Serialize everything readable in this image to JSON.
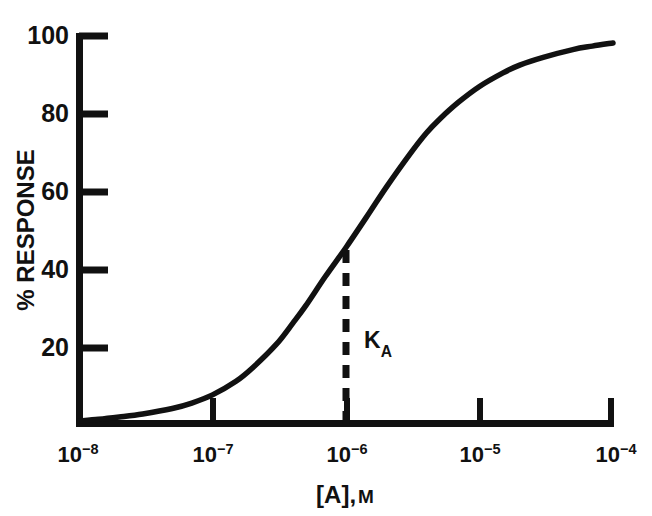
{
  "chart_data": {
    "type": "line",
    "title": "",
    "subtitle": "",
    "xlabel": "[A], M",
    "xlabel_parts": {
      "bracket_open": "[",
      "species": "A",
      "bracket_close": "]",
      "comma": ",",
      "unit": "M"
    },
    "ylabel": "% RESPONSE",
    "x_scale": "log",
    "y_scale": "linear",
    "xlim": [
      1e-08,
      0.0001
    ],
    "ylim": [
      0,
      100
    ],
    "grid": false,
    "legend": null,
    "x_tick_labels": [
      "10-8",
      "10-7",
      "10-6",
      "10-5",
      "10-4"
    ],
    "x_ticks": [
      {
        "mantissa": "10",
        "exponent": "−8",
        "value": 1e-08
      },
      {
        "mantissa": "10",
        "exponent": "−7",
        "value": 1e-07
      },
      {
        "mantissa": "10",
        "exponent": "−6",
        "value": 1e-06
      },
      {
        "mantissa": "10",
        "exponent": "−5",
        "value": 1e-05
      },
      {
        "mantissa": "10",
        "exponent": "−4",
        "value": 0.0001
      }
    ],
    "y_ticks": [
      20,
      40,
      60,
      80,
      100
    ],
    "y_tick_labels": [
      "20",
      "40",
      "60",
      "80",
      "100"
    ],
    "tick_direction": "in",
    "series": [
      {
        "name": "response",
        "color": "#111111",
        "points": [
          {
            "x": 1e-08,
            "y": 0.8
          },
          {
            "x": 1.4e-08,
            "y": 1.2
          },
          {
            "x": 2e-08,
            "y": 1.8
          },
          {
            "x": 3e-08,
            "y": 2.6
          },
          {
            "x": 5e-08,
            "y": 4.0
          },
          {
            "x": 7e-08,
            "y": 5.4
          },
          {
            "x": 1e-07,
            "y": 7.5
          },
          {
            "x": 1.5e-07,
            "y": 11.0
          },
          {
            "x": 2e-07,
            "y": 14.5
          },
          {
            "x": 3e-07,
            "y": 20.5
          },
          {
            "x": 4e-07,
            "y": 26.0
          },
          {
            "x": 5e-07,
            "y": 30.5
          },
          {
            "x": 7e-07,
            "y": 38.0
          },
          {
            "x": 1e-06,
            "y": 45.5
          },
          {
            "x": 1.5e-06,
            "y": 54.5
          },
          {
            "x": 2e-06,
            "y": 61.0
          },
          {
            "x": 3e-06,
            "y": 69.5
          },
          {
            "x": 4e-06,
            "y": 75.0
          },
          {
            "x": 5e-06,
            "y": 78.5
          },
          {
            "x": 7e-06,
            "y": 83.0
          },
          {
            "x": 1e-05,
            "y": 87.0
          },
          {
            "x": 1.5e-05,
            "y": 90.5
          },
          {
            "x": 2e-05,
            "y": 92.5
          },
          {
            "x": 3e-05,
            "y": 94.5
          },
          {
            "x": 5e-05,
            "y": 96.5
          },
          {
            "x": 7e-05,
            "y": 97.4
          },
          {
            "x": 0.0001,
            "y": 98.2
          }
        ]
      }
    ],
    "annotations": [
      {
        "name": "ka-marker",
        "label": "K",
        "label_subscript": "A",
        "type": "vline-dashed",
        "x": 1e-06,
        "y_from": 0,
        "y_to": 45.5,
        "color": "#111111"
      }
    ],
    "colors": {
      "background": "#ffffff",
      "axis": "#111111",
      "curve": "#111111",
      "annotation": "#111111"
    }
  }
}
